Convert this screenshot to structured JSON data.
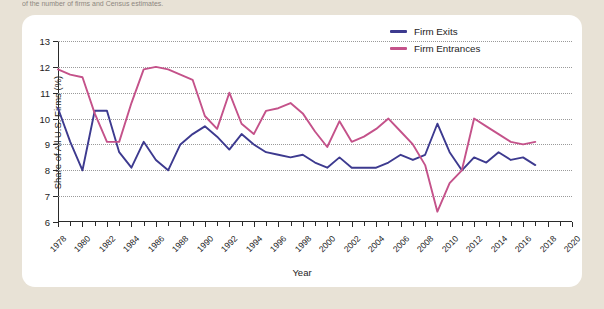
{
  "page": {
    "top_caption": "of the number of firms and Census estimates.",
    "background_color": "#e8e2d6",
    "card_color": "#ffffff"
  },
  "legend": {
    "position": "top-right",
    "items": [
      {
        "label": "Firm Exits",
        "color": "#3d3a8f",
        "icon": "line-swatch"
      },
      {
        "label": "Firm Entrances",
        "color": "#c4528a",
        "icon": "line-swatch"
      }
    ]
  },
  "chart_data": {
    "type": "line",
    "title": "",
    "subtitle": "",
    "xlabel": "Year",
    "ylabel": "Share of All U.S. Firms (%)",
    "xlim": [
      1978,
      2020
    ],
    "ylim": [
      6,
      13
    ],
    "ytick_labels": [
      "6",
      "7",
      "8",
      "9",
      "10",
      "11",
      "12",
      "13"
    ],
    "ytick_values": [
      6,
      7,
      8,
      9,
      10,
      11,
      12,
      13
    ],
    "xtick_labels": [
      "1978",
      "1980",
      "1982",
      "1984",
      "1986",
      "1988",
      "1990",
      "1992",
      "1994",
      "1996",
      "1998",
      "2000",
      "2002",
      "2004",
      "2006",
      "2008",
      "2010",
      "2012",
      "2014",
      "2016",
      "2018",
      "2020"
    ],
    "xtick_values": [
      1978,
      1980,
      1982,
      1984,
      1986,
      1988,
      1990,
      1992,
      1994,
      1996,
      1998,
      2000,
      2002,
      2004,
      2006,
      2008,
      2010,
      2012,
      2014,
      2016,
      2018,
      2020
    ],
    "xtick_minor_step": 1,
    "grid": {
      "horizontal": true,
      "vertical": false,
      "style": "dotted",
      "color": "#9a9a9a"
    },
    "legend_position": "top-right",
    "x": [
      1978,
      1979,
      1980,
      1981,
      1982,
      1983,
      1984,
      1985,
      1986,
      1987,
      1988,
      1989,
      1990,
      1991,
      1992,
      1993,
      1994,
      1995,
      1996,
      1997,
      1998,
      1999,
      2000,
      2001,
      2002,
      2003,
      2004,
      2005,
      2006,
      2007,
      2008,
      2009,
      2010,
      2011,
      2012,
      2013,
      2014,
      2015,
      2016,
      2017
    ],
    "series": [
      {
        "name": "Firm Exits",
        "color": "#3d3a8f",
        "values": [
          10.4,
          9.1,
          8.0,
          10.3,
          10.3,
          8.7,
          8.1,
          9.1,
          8.4,
          8.0,
          9.0,
          9.4,
          9.7,
          9.3,
          8.8,
          9.4,
          9.0,
          8.7,
          8.6,
          8.5,
          8.6,
          8.3,
          8.1,
          8.5,
          8.1,
          8.1,
          8.1,
          8.3,
          8.6,
          8.4,
          8.6,
          9.8,
          8.7,
          8.0,
          8.5,
          8.3,
          8.7,
          8.4,
          8.5,
          8.2
        ]
      },
      {
        "name": "Firm Entrances",
        "color": "#c4528a",
        "values": [
          11.9,
          11.7,
          11.6,
          10.2,
          9.1,
          9.1,
          10.6,
          11.9,
          12.0,
          11.9,
          11.7,
          11.5,
          10.1,
          9.6,
          11.0,
          9.8,
          9.4,
          10.3,
          10.4,
          10.6,
          10.2,
          9.5,
          8.9,
          9.9,
          9.1,
          9.3,
          9.6,
          10.0,
          9.5,
          9.0,
          8.2,
          6.4,
          7.5,
          8.0,
          10.0,
          9.7,
          9.4,
          9.1,
          9.0,
          9.1
        ]
      }
    ]
  }
}
